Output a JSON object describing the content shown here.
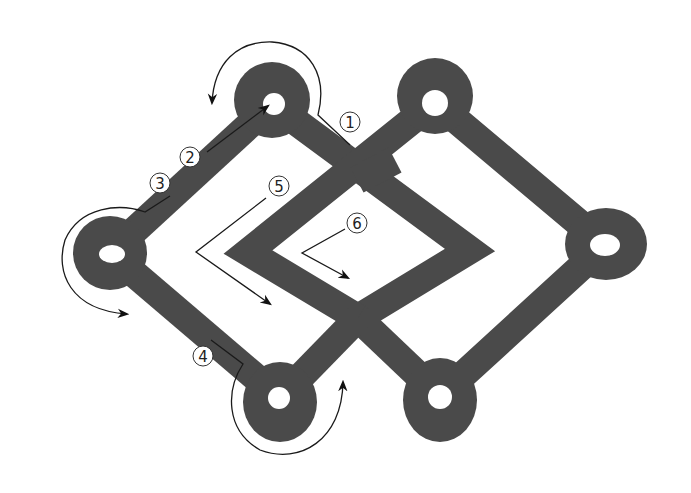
{
  "diagram": {
    "type": "knot-tying-instructions",
    "band_color": "#4a4a4a",
    "background": "#ffffff",
    "loops": [
      {
        "name": "left-loop",
        "cx": 110,
        "cy": 253
      },
      {
        "name": "top-left-loop",
        "cx": 272,
        "cy": 104
      },
      {
        "name": "top-right-loop",
        "cx": 435,
        "cy": 102
      },
      {
        "name": "right-loop",
        "cx": 605,
        "cy": 245
      },
      {
        "name": "bottom-left-loop",
        "cx": 280,
        "cy": 398
      },
      {
        "name": "bottom-right-loop",
        "cx": 440,
        "cy": 396
      }
    ],
    "steps": [
      {
        "label": "1",
        "x": 350,
        "y": 122
      },
      {
        "label": "2",
        "x": 190,
        "y": 158
      },
      {
        "label": "3",
        "x": 160,
        "y": 183
      },
      {
        "label": "4",
        "x": 203,
        "y": 356
      },
      {
        "label": "5",
        "x": 279,
        "y": 187
      },
      {
        "label": "6",
        "x": 357,
        "y": 224
      }
    ]
  }
}
